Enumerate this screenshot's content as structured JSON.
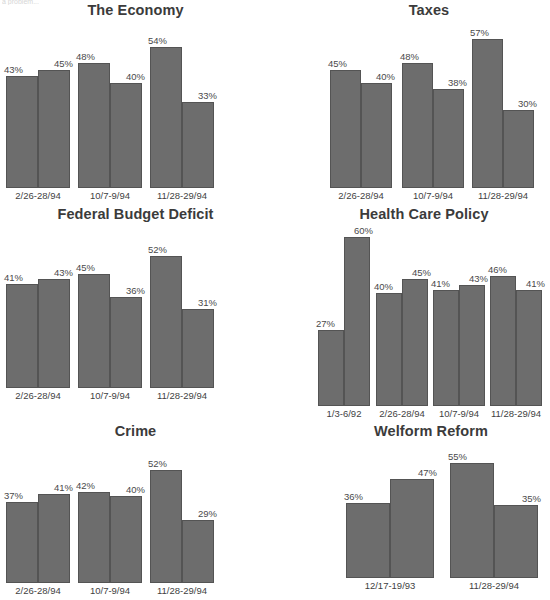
{
  "page": {
    "clipped_header_text": "a problem...",
    "background": "#ffffff",
    "bar_color": "#6d6d6d",
    "bar_outline": "#545454",
    "label_suffix": "%"
  },
  "chart_data": [
    {
      "type": "bar",
      "title": "The Economy",
      "xlabel": "",
      "ylabel": "",
      "ylim": [
        0,
        62
      ],
      "grid": false,
      "legend": "none",
      "categories": [
        "2/26-28/94",
        "10/7-9/94",
        "11/28-29/94"
      ],
      "series": [
        {
          "name": "bar-left",
          "values": [
            43,
            48,
            54
          ]
        },
        {
          "name": "bar-right",
          "values": [
            45,
            40,
            33
          ]
        }
      ],
      "labels": [
        [
          "43%",
          "45%"
        ],
        [
          "48%",
          "40%"
        ],
        [
          "54%",
          "33%"
        ]
      ]
    },
    {
      "type": "bar",
      "title": "Taxes",
      "xlabel": "",
      "ylabel": "",
      "ylim": [
        0,
        62
      ],
      "grid": false,
      "legend": "none",
      "categories": [
        "2/26-28/94",
        "10/7-9/94",
        "11/28-29/94"
      ],
      "series": [
        {
          "name": "bar-left",
          "values": [
            45,
            48,
            57
          ]
        },
        {
          "name": "bar-right",
          "values": [
            40,
            38,
            30
          ]
        }
      ],
      "labels": [
        [
          "45%",
          "40%"
        ],
        [
          "48%",
          "38%"
        ],
        [
          "57%",
          "30%"
        ]
      ]
    },
    {
      "type": "bar",
      "title": "Federal Budget Deficit",
      "xlabel": "",
      "ylabel": "",
      "ylim": [
        0,
        62
      ],
      "grid": false,
      "legend": "none",
      "categories": [
        "2/26-28/94",
        "10/7-9/94",
        "11/28-29/94"
      ],
      "series": [
        {
          "name": "bar-left",
          "values": [
            41,
            45,
            52
          ]
        },
        {
          "name": "bar-right",
          "values": [
            43,
            36,
            31
          ]
        }
      ],
      "labels": [
        [
          "41%",
          "43%"
        ],
        [
          "45%",
          "36%"
        ],
        [
          "52%",
          "31%"
        ]
      ]
    },
    {
      "type": "bar",
      "title": "Health Care Policy",
      "xlabel": "",
      "ylabel": "",
      "ylim": [
        0,
        62
      ],
      "grid": false,
      "legend": "none",
      "categories": [
        "1/3-6/92",
        "2/26-28/94",
        "10/7-9/94",
        "11/28-29/94"
      ],
      "series": [
        {
          "name": "bar-left",
          "values": [
            27,
            40,
            41,
            46
          ]
        },
        {
          "name": "bar-right",
          "values": [
            60,
            45,
            43,
            41
          ]
        }
      ],
      "labels": [
        [
          "27%",
          "60%"
        ],
        [
          "40%",
          "45%"
        ],
        [
          "41%",
          "43%"
        ],
        [
          "46%",
          "41%"
        ]
      ]
    },
    {
      "type": "bar",
      "title": "Crime",
      "xlabel": "",
      "ylabel": "",
      "ylim": [
        0,
        62
      ],
      "grid": false,
      "legend": "none",
      "categories": [
        "2/26-28/94",
        "10/7-9/94",
        "11/28-29/94"
      ],
      "series": [
        {
          "name": "bar-left",
          "values": [
            37,
            42,
            52
          ]
        },
        {
          "name": "bar-right",
          "values": [
            41,
            40,
            29
          ]
        }
      ],
      "labels": [
        [
          "37%",
          "41%"
        ],
        [
          "42%",
          "40%"
        ],
        [
          "52%",
          "29%"
        ]
      ]
    },
    {
      "type": "bar",
      "title": "Welform Reform",
      "xlabel": "",
      "ylabel": "",
      "ylim": [
        0,
        62
      ],
      "grid": false,
      "legend": "none",
      "categories": [
        "12/17-19/93",
        "11/28-29/94"
      ],
      "series": [
        {
          "name": "bar-left",
          "values": [
            36,
            55
          ]
        },
        {
          "name": "bar-right",
          "values": [
            47,
            35
          ]
        }
      ],
      "labels": [
        [
          "36%",
          "47%"
        ],
        [
          "55%",
          "35%"
        ]
      ]
    }
  ],
  "layout": [
    {
      "left": 0,
      "top": 2,
      "width": 271,
      "plotTop": 26,
      "plotH": 162,
      "labelTop": 190,
      "groups": [
        {
          "x": 6,
          "w": 64
        },
        {
          "x": 78,
          "w": 64
        },
        {
          "x": 150,
          "w": 64
        }
      ]
    },
    {
      "left": 316,
      "top": 2,
      "width": 226,
      "plotTop": 26,
      "plotH": 162,
      "labelTop": 190,
      "groups": [
        {
          "x": 14,
          "w": 62
        },
        {
          "x": 86,
          "w": 62
        },
        {
          "x": 156,
          "w": 62
        }
      ]
    },
    {
      "left": 0,
      "top": 206,
      "width": 271,
      "plotTop": 231,
      "plotH": 157,
      "labelTop": 390,
      "groups": [
        {
          "x": 6,
          "w": 64
        },
        {
          "x": 78,
          "w": 64
        },
        {
          "x": 150,
          "w": 64
        }
      ]
    },
    {
      "left": 306,
      "top": 206,
      "width": 236,
      "plotTop": 231,
      "plotH": 175,
      "labelTop": 408,
      "groups": [
        {
          "x": 12,
          "w": 52
        },
        {
          "x": 70,
          "w": 52
        },
        {
          "x": 127,
          "w": 52
        },
        {
          "x": 184,
          "w": 52
        }
      ]
    },
    {
      "left": 0,
      "top": 423,
      "width": 271,
      "plotTop": 448,
      "plotH": 135,
      "labelTop": 585,
      "groups": [
        {
          "x": 6,
          "w": 64
        },
        {
          "x": 78,
          "w": 64
        },
        {
          "x": 150,
          "w": 64
        }
      ]
    },
    {
      "left": 320,
      "top": 423,
      "width": 222,
      "plotTop": 448,
      "plotH": 130,
      "labelTop": 580,
      "groups": [
        {
          "x": 26,
          "w": 88
        },
        {
          "x": 130,
          "w": 88
        }
      ]
    }
  ]
}
